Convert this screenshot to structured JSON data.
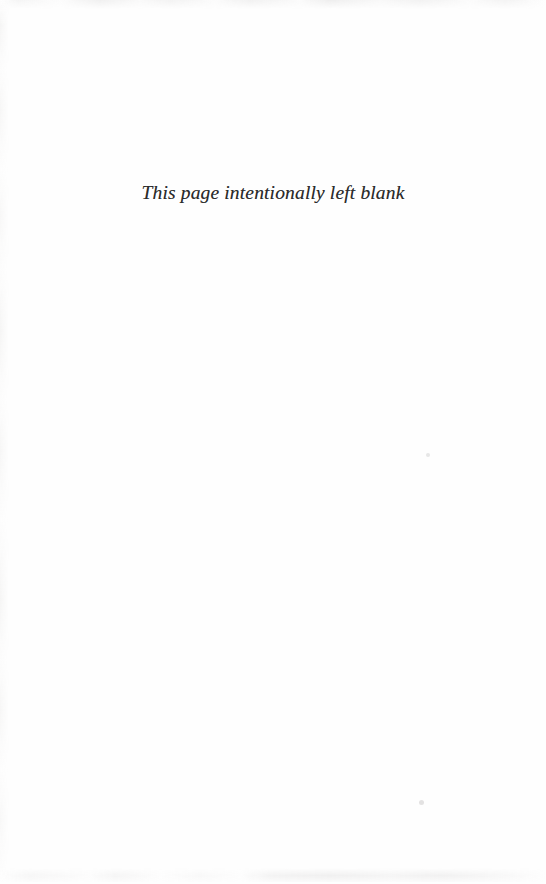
{
  "document": {
    "page_type": "blank-placeholder-page",
    "background_color": "#ffffff",
    "text_color": "#2b2b2b"
  },
  "notice": {
    "text": "This page intentionally left blank"
  },
  "artifacts": {
    "top_band": "scan-smudge-top-edge",
    "bottom_band": "scan-smudge-bottom-edge",
    "left_streaks": "scan-streaks-left-margin",
    "speck_mid": "dust-speck",
    "speck_low": "dust-speck"
  }
}
